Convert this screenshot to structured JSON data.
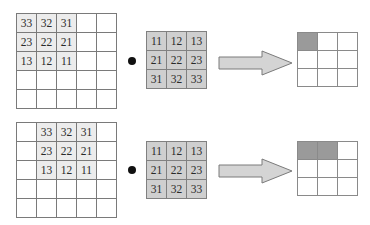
{
  "diagram": {
    "title": "",
    "operator_symbol": "dot",
    "rows": [
      {
        "input": {
          "size": [
            5,
            5
          ],
          "values": [
            [
              "33",
              "32",
              "31",
              "",
              ""
            ],
            [
              "23",
              "22",
              "21",
              "",
              ""
            ],
            [
              "13",
              "12",
              "11",
              "",
              ""
            ],
            [
              "",
              "",
              "",
              "",
              ""
            ],
            [
              "",
              "",
              "",
              "",
              ""
            ]
          ],
          "highlight": [
            [
              1,
              1,
              1,
              0,
              0
            ],
            [
              1,
              1,
              1,
              0,
              0
            ],
            [
              1,
              1,
              1,
              0,
              0
            ],
            [
              0,
              0,
              0,
              0,
              0
            ],
            [
              0,
              0,
              0,
              0,
              0
            ]
          ]
        },
        "kernel": {
          "values": [
            [
              "11",
              "12",
              "13"
            ],
            [
              "21",
              "22",
              "23"
            ],
            [
              "31",
              "32",
              "33"
            ]
          ]
        },
        "output": {
          "size": [
            3,
            3
          ],
          "filled": [
            [
              1,
              0,
              0
            ],
            [
              0,
              0,
              0
            ],
            [
              0,
              0,
              0
            ]
          ]
        }
      },
      {
        "input": {
          "size": [
            5,
            5
          ],
          "values": [
            [
              "",
              "33",
              "32",
              "31",
              ""
            ],
            [
              "",
              "23",
              "22",
              "21",
              ""
            ],
            [
              "",
              "13",
              "12",
              "11",
              ""
            ],
            [
              "",
              "",
              "",
              "",
              ""
            ],
            [
              "",
              "",
              "",
              "",
              ""
            ]
          ],
          "highlight": [
            [
              0,
              1,
              1,
              1,
              0
            ],
            [
              0,
              1,
              1,
              1,
              0
            ],
            [
              0,
              1,
              1,
              1,
              0
            ],
            [
              0,
              0,
              0,
              0,
              0
            ],
            [
              0,
              0,
              0,
              0,
              0
            ]
          ]
        },
        "kernel": {
          "values": [
            [
              "11",
              "12",
              "13"
            ],
            [
              "21",
              "22",
              "23"
            ],
            [
              "31",
              "32",
              "33"
            ]
          ]
        },
        "output": {
          "size": [
            3,
            3
          ],
          "filled": [
            [
              1,
              1,
              0
            ],
            [
              0,
              0,
              0
            ],
            [
              0,
              0,
              0
            ]
          ]
        }
      }
    ],
    "colors": {
      "input_highlight": "#ececec",
      "kernel_fill": "#cfcfcf",
      "output_filled": "#9a9a9a",
      "arrow_fill": "#d4d4d4",
      "arrow_stroke": "#7a7a7a",
      "grid_line": "#7a7a7a"
    }
  }
}
